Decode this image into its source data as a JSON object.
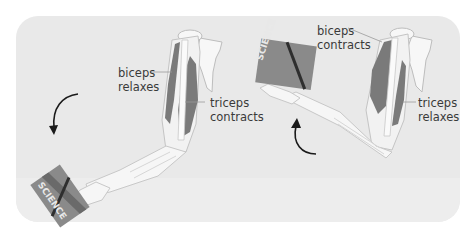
{
  "figure": {
    "left_panel": {
      "state": "arm extending",
      "biceps_label": [
        "biceps",
        "relaxes"
      ],
      "triceps_label": [
        "triceps",
        "contracts"
      ],
      "book_title": "SCIENCE",
      "arrow": "downward curved arrow"
    },
    "right_panel": {
      "state": "arm flexing",
      "biceps_label": [
        "biceps",
        "contracts"
      ],
      "triceps_label": [
        "triceps",
        "relaxes"
      ],
      "book_title": "SCIENCE",
      "arrow": "upward curved arrow"
    },
    "colors": {
      "panel_bg": "#e9e9e9",
      "muscle": "#7a7a7a",
      "bone": "#f7f7f7",
      "outline": "#bdbdbd",
      "arrow": "#1a1a1a",
      "text": "#3a3a3a"
    }
  }
}
